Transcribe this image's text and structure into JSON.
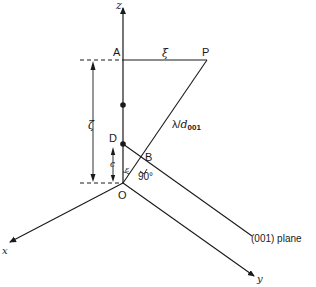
{
  "diagram": {
    "axes": {
      "z": "z",
      "x": "x",
      "y": "y"
    },
    "points": {
      "A": "A",
      "P": "P",
      "D": "D",
      "B": "B",
      "O": "O"
    },
    "labels": {
      "xi": "ξ",
      "zeta": "ζ",
      "c": "c",
      "epsilon": "ε",
      "right_angle": "90°",
      "lambda_over": "λ/",
      "d": "d",
      "d_sub": "001",
      "plane": "(001) plane"
    },
    "colors": {
      "line": "#1a1a1a",
      "background": "#ffffff"
    }
  }
}
